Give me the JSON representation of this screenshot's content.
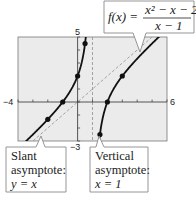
{
  "chart_data": {
    "type": "line",
    "title": "",
    "function_label": {
      "lhs": "f(x) = ",
      "numerator": "x² − x − 2",
      "denominator": "x − 1"
    },
    "xlim": [
      -4,
      6
    ],
    "ylim": [
      -3,
      5
    ],
    "x_tick_labels": {
      "min": "−4",
      "max": "6"
    },
    "y_tick_labels": {
      "max": "5",
      "min": "−3"
    },
    "x_ticks": [
      -4,
      -3,
      -2,
      -1,
      0,
      1,
      2,
      3,
      4,
      5,
      6
    ],
    "y_ticks": [
      -3,
      -2,
      -1,
      0,
      1,
      2,
      3,
      4,
      5
    ],
    "grid": false,
    "series": [
      {
        "name": "left branch",
        "domain": [
          -4,
          0.62
        ]
      },
      {
        "name": "right branch",
        "domain": [
          1.37,
          6
        ]
      }
    ],
    "points": [
      {
        "x": -2,
        "y": -1.33
      },
      {
        "x": -1,
        "y": 0
      },
      {
        "x": 0,
        "y": 2
      },
      {
        "x": 0.5,
        "y": 4.5
      },
      {
        "x": 1.5,
        "y": -2.5
      },
      {
        "x": 2,
        "y": 0
      },
      {
        "x": 3,
        "y": 2
      }
    ],
    "asymptotes": {
      "slant": {
        "equation": "y = x"
      },
      "vertical": {
        "x": 1
      }
    },
    "annotations": {
      "slant": [
        "Slant",
        "asymptote:",
        "y = x"
      ],
      "vertical": [
        "Vertical",
        "asymptote:",
        "x = 1"
      ]
    },
    "colors": {
      "plot_bg": "#ebebeb",
      "curve": "#111111",
      "asymptote": "#9a9a9a",
      "box_border": "#8a8a8a"
    }
  }
}
